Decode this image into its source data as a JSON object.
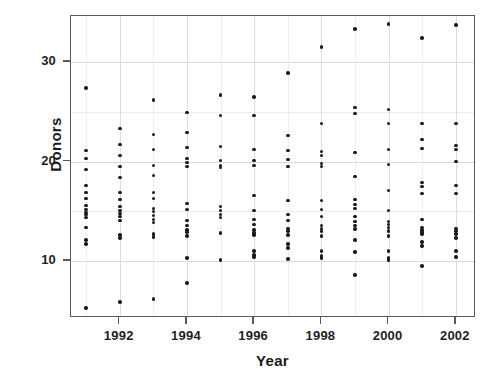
{
  "chart_data": {
    "type": "scatter",
    "title": "",
    "xlabel": "Year",
    "ylabel": "Donors",
    "xlim": [
      1990.55,
      2002.6
    ],
    "ylim": [
      4.3,
      34.6
    ],
    "grid": true,
    "legend": false,
    "xticks": [
      1992,
      1994,
      1996,
      1998,
      2000,
      2002
    ],
    "xtick_labels": [
      "1992",
      "1994",
      "1996",
      "1998",
      "2000",
      "2002"
    ],
    "x_minor_gridlines": [
      1991,
      1993,
      1995,
      1997,
      1999,
      2001
    ],
    "yticks": [
      10,
      20,
      30
    ],
    "ytick_labels": [
      "10",
      "20",
      "30"
    ],
    "y_minor_gridlines": [
      15,
      25
    ],
    "point_color": "#1c1c1c",
    "frame_color": "#5a5a5a",
    "grid_color": "#d9d9d9",
    "background": "#ffffff",
    "series": [
      {
        "name": "Donors by year",
        "points": [
          [
            1991,
            27.4
          ],
          [
            1991,
            21.1
          ],
          [
            1991,
            20.3
          ],
          [
            1991,
            19.2
          ],
          [
            1991,
            17.6
          ],
          [
            1991,
            16.9
          ],
          [
            1991,
            16.3
          ],
          [
            1991,
            15.6
          ],
          [
            1991,
            15.2
          ],
          [
            1991,
            14.9
          ],
          [
            1991,
            14.7
          ],
          [
            1991,
            14.4
          ],
          [
            1991,
            13.4
          ],
          [
            1991,
            12.1
          ],
          [
            1991,
            11.7
          ],
          [
            1991,
            5.3
          ],
          [
            1992,
            23.3
          ],
          [
            1992,
            21.7
          ],
          [
            1992,
            20.6
          ],
          [
            1992,
            19.5
          ],
          [
            1992,
            18.4
          ],
          [
            1992,
            16.9
          ],
          [
            1992,
            16.2
          ],
          [
            1992,
            15.5
          ],
          [
            1992,
            15.1
          ],
          [
            1992,
            14.8
          ],
          [
            1992,
            14.5
          ],
          [
            1992,
            14.1
          ],
          [
            1992,
            12.6
          ],
          [
            1992,
            12.3
          ],
          [
            1992,
            5.9
          ],
          [
            1993,
            26.2
          ],
          [
            1993,
            22.7
          ],
          [
            1993,
            21.2
          ],
          [
            1993,
            19.6
          ],
          [
            1993,
            18.6
          ],
          [
            1993,
            16.9
          ],
          [
            1993,
            16.3
          ],
          [
            1993,
            15.3
          ],
          [
            1993,
            15.0
          ],
          [
            1993,
            14.6
          ],
          [
            1993,
            14.2
          ],
          [
            1993,
            13.9
          ],
          [
            1993,
            12.7
          ],
          [
            1993,
            12.4
          ],
          [
            1993,
            6.2
          ],
          [
            1994,
            24.9
          ],
          [
            1994,
            22.9
          ],
          [
            1994,
            21.4
          ],
          [
            1994,
            20.3
          ],
          [
            1994,
            19.9
          ],
          [
            1994,
            19.5
          ],
          [
            1994,
            15.8
          ],
          [
            1994,
            15.2
          ],
          [
            1994,
            14.1
          ],
          [
            1994,
            13.6
          ],
          [
            1994,
            13.1
          ],
          [
            1994,
            12.9
          ],
          [
            1994,
            12.5
          ],
          [
            1994,
            10.3
          ],
          [
            1994,
            7.8
          ],
          [
            1995,
            26.7
          ],
          [
            1995,
            24.6
          ],
          [
            1995,
            21.5
          ],
          [
            1995,
            20.1
          ],
          [
            1995,
            19.6
          ],
          [
            1995,
            19.4
          ],
          [
            1995,
            15.5
          ],
          [
            1995,
            15.1
          ],
          [
            1995,
            14.7
          ],
          [
            1995,
            14.4
          ],
          [
            1995,
            12.8
          ],
          [
            1995,
            10.1
          ],
          [
            1996,
            26.5
          ],
          [
            1996,
            24.6
          ],
          [
            1996,
            21.2
          ],
          [
            1996,
            20.1
          ],
          [
            1996,
            19.6
          ],
          [
            1996,
            16.6
          ],
          [
            1996,
            15.1
          ],
          [
            1996,
            14.2
          ],
          [
            1996,
            13.7
          ],
          [
            1996,
            13.1
          ],
          [
            1996,
            12.8
          ],
          [
            1996,
            12.6
          ],
          [
            1996,
            11.0
          ],
          [
            1996,
            10.6
          ],
          [
            1996,
            10.4
          ],
          [
            1997,
            28.9
          ],
          [
            1997,
            22.6
          ],
          [
            1997,
            21.1
          ],
          [
            1997,
            20.2
          ],
          [
            1997,
            19.5
          ],
          [
            1997,
            16.1
          ],
          [
            1997,
            14.7
          ],
          [
            1997,
            14.1
          ],
          [
            1997,
            13.3
          ],
          [
            1997,
            13.0
          ],
          [
            1997,
            12.6
          ],
          [
            1997,
            11.7
          ],
          [
            1997,
            11.3
          ],
          [
            1997,
            10.2
          ],
          [
            1998,
            31.5
          ],
          [
            1998,
            23.8
          ],
          [
            1998,
            21.0
          ],
          [
            1998,
            20.6
          ],
          [
            1998,
            19.8
          ],
          [
            1998,
            19.5
          ],
          [
            1998,
            16.1
          ],
          [
            1998,
            15.2
          ],
          [
            1998,
            14.5
          ],
          [
            1998,
            13.6
          ],
          [
            1998,
            13.3
          ],
          [
            1998,
            13.0
          ],
          [
            1998,
            12.5
          ],
          [
            1998,
            11.0
          ],
          [
            1998,
            10.5
          ],
          [
            1998,
            10.3
          ],
          [
            1999,
            33.3
          ],
          [
            1999,
            25.4
          ],
          [
            1999,
            24.8
          ],
          [
            1999,
            20.9
          ],
          [
            1999,
            18.5
          ],
          [
            1999,
            16.2
          ],
          [
            1999,
            15.7
          ],
          [
            1999,
            15.3
          ],
          [
            1999,
            14.5
          ],
          [
            1999,
            14.0
          ],
          [
            1999,
            13.6
          ],
          [
            1999,
            13.2
          ],
          [
            1999,
            12.1
          ],
          [
            1999,
            10.9
          ],
          [
            1999,
            8.6
          ],
          [
            2000,
            33.8
          ],
          [
            2000,
            25.2
          ],
          [
            2000,
            23.8
          ],
          [
            2000,
            21.2
          ],
          [
            2000,
            19.7
          ],
          [
            2000,
            17.1
          ],
          [
            2000,
            15.1
          ],
          [
            2000,
            14.0
          ],
          [
            2000,
            13.7
          ],
          [
            2000,
            13.4
          ],
          [
            2000,
            13.0
          ],
          [
            2000,
            12.5
          ],
          [
            2000,
            11.0
          ],
          [
            2000,
            10.3
          ],
          [
            2000,
            10.1
          ],
          [
            2001,
            32.4
          ],
          [
            2001,
            23.8
          ],
          [
            2001,
            22.2
          ],
          [
            2001,
            21.3
          ],
          [
            2001,
            17.9
          ],
          [
            2001,
            17.5
          ],
          [
            2001,
            16.8
          ],
          [
            2001,
            14.2
          ],
          [
            2001,
            13.4
          ],
          [
            2001,
            13.1
          ],
          [
            2001,
            12.9
          ],
          [
            2001,
            12.7
          ],
          [
            2001,
            11.9
          ],
          [
            2001,
            11.5
          ],
          [
            2001,
            9.5
          ],
          [
            2002,
            33.7
          ],
          [
            2002,
            23.8
          ],
          [
            2002,
            21.6
          ],
          [
            2002,
            21.2
          ],
          [
            2002,
            20.0
          ],
          [
            2002,
            17.6
          ],
          [
            2002,
            16.8
          ],
          [
            2002,
            13.3
          ],
          [
            2002,
            13.0
          ],
          [
            2002,
            12.7
          ],
          [
            2002,
            12.3
          ],
          [
            2002,
            11.0
          ],
          [
            2002,
            10.4
          ]
        ]
      }
    ]
  }
}
